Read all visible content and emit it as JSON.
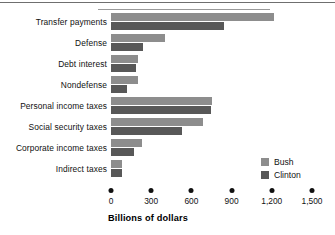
{
  "chart_data": {
    "type": "bar",
    "orientation": "horizontal",
    "title": "",
    "xlabel": "Billions of dollars",
    "ylabel": "",
    "xlim": [
      0,
      1500
    ],
    "xticks": [
      0,
      300,
      600,
      900,
      1200,
      1500
    ],
    "xtick_labels": [
      "0",
      "300",
      "600",
      "900",
      "1,200",
      "1,500"
    ],
    "grid": false,
    "legend_position": "center-right",
    "categories": [
      "Transfer payments",
      "Defense",
      "Debt interest",
      "Nondefense",
      "Personal income taxes",
      "Social security taxes",
      "Corporate income taxes",
      "Indirect taxes"
    ],
    "series": [
      {
        "name": "Bush",
        "color": "#8d8d8d",
        "values": [
          1215,
          405,
          200,
          205,
          755,
          685,
          235,
          85
        ]
      },
      {
        "name": "Clinton",
        "color": "#585858",
        "values": [
          840,
          240,
          185,
          120,
          745,
          530,
          170,
          80
        ]
      }
    ]
  },
  "legend": {
    "items": [
      {
        "label": "Bush",
        "color": "#8d8d8d"
      },
      {
        "label": "Clinton",
        "color": "#585858"
      }
    ]
  }
}
